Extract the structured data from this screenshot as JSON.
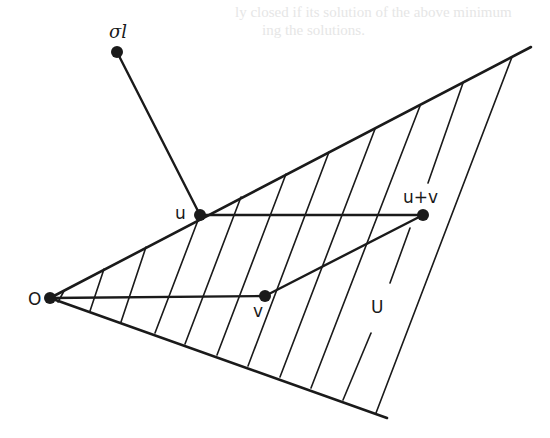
{
  "figure": {
    "type": "convex cone diagram",
    "background": "#ffffff",
    "stroke_color": "#1a1a1a",
    "points": [
      {
        "id": "O",
        "label": "O",
        "x": 50,
        "y": 298
      },
      {
        "id": "u",
        "label": "u",
        "x": 200,
        "y": 215
      },
      {
        "id": "v",
        "label": "v",
        "x": 265,
        "y": 296
      },
      {
        "id": "u_plus_v",
        "label": "u+v",
        "x": 423,
        "y": 215
      },
      {
        "id": "sigma_l",
        "label": "σl",
        "x": 117,
        "y": 52
      }
    ],
    "region_label": {
      "text": "U",
      "x": 378,
      "y": 313
    },
    "cone_boundaries": [
      {
        "name": "upper",
        "x1": 50,
        "y1": 298,
        "x2": 531,
        "y2": 47
      },
      {
        "name": "lower",
        "x1": 50,
        "y1": 298,
        "x2": 387,
        "y2": 418
      }
    ],
    "segments": [
      {
        "name": "sigma-to-u",
        "x1": 117,
        "y1": 52,
        "x2": 200,
        "y2": 215
      },
      {
        "name": "u-to-uplusv",
        "x1": 200,
        "y1": 215,
        "x2": 423,
        "y2": 215
      },
      {
        "name": "O-to-v",
        "x1": 50,
        "y1": 298,
        "x2": 265,
        "y2": 296
      },
      {
        "name": "v-to-uplusv",
        "x1": 265,
        "y1": 296,
        "x2": 423,
        "y2": 215
      }
    ],
    "hatch_lines": [
      {
        "x1": 64,
        "y1": 291,
        "x2": 58,
        "y2": 302
      },
      {
        "x1": 104,
        "y1": 269,
        "x2": 90,
        "y2": 311
      },
      {
        "x1": 146,
        "y1": 247,
        "x2": 121,
        "y2": 322
      },
      {
        "x1": 200,
        "y1": 215,
        "x2": 155,
        "y2": 333
      },
      {
        "x1": 241,
        "y1": 197,
        "x2": 185,
        "y2": 344
      },
      {
        "x1": 286,
        "y1": 174,
        "x2": 217,
        "y2": 355
      },
      {
        "x1": 329,
        "y1": 152,
        "x2": 248,
        "y2": 366
      },
      {
        "x1": 375,
        "y1": 129,
        "x2": 280,
        "y2": 377
      },
      {
        "x1": 420,
        "y1": 106,
        "x2": 311,
        "y2": 388
      },
      {
        "x1": 463,
        "y1": 83,
        "x2": 428,
        "y2": 183
      },
      {
        "x1": 410,
        "y1": 228,
        "x2": 390,
        "y2": 283
      },
      {
        "x1": 371,
        "y1": 333,
        "x2": 343,
        "y2": 400
      },
      {
        "x1": 512,
        "y1": 57,
        "x2": 376,
        "y2": 413
      }
    ],
    "bleed_through_text": [
      {
        "text": "ly closed if its solution of the above minimum",
        "x": 235,
        "y": 4
      },
      {
        "text": "ing the solutions.",
        "x": 262,
        "y": 22
      }
    ]
  }
}
